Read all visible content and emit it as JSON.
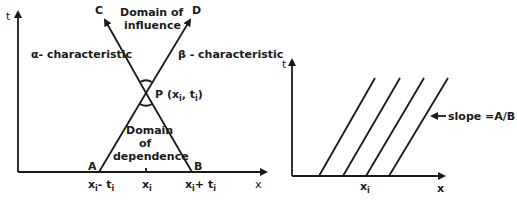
{
  "left_diagram": {
    "t_axis_label": "t",
    "x_axis_label": "x",
    "point_C": "C",
    "point_D": "D",
    "point_A": "A",
    "point_B": "B",
    "point_P": "P (x",
    "point_P_sub": "i",
    "point_P_mid": ", t",
    "point_P_sub2": "i",
    "point_P_end": ")",
    "domain_influence_line1": "Domain of",
    "domain_influence_line2": "influence",
    "domain_dependence_line1": "Domain",
    "domain_dependence_line2": "of",
    "domain_dependence_line3": "dependence",
    "alpha_characteristic": "α- characteristic",
    "beta_characteristic": "β - characteristic",
    "tick_left": "x",
    "tick_left_sub": "i",
    "tick_left_rest": "- t",
    "tick_left_sub2": "i",
    "tick_mid": "x",
    "tick_mid_sub": "i",
    "tick_right": "x",
    "tick_right_sub": "i",
    "tick_right_rest": "+ t",
    "tick_right_sub2": "i"
  },
  "right_diagram": {
    "t_axis_label": "t",
    "x_axis_label": "x",
    "tick_label": "x",
    "tick_label_sub": "i",
    "slope_label": "slope =A/B",
    "line_count": 4
  }
}
